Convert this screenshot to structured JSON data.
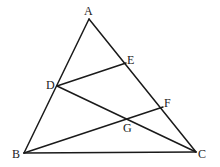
{
  "figure": {
    "type": "geometry",
    "points": {
      "A": {
        "label": "A"
      },
      "B": {
        "label": "B"
      },
      "C": {
        "label": "C"
      },
      "D": {
        "label": "D"
      },
      "E": {
        "label": "E"
      },
      "F": {
        "label": "F"
      },
      "G": {
        "label": "G"
      }
    },
    "segments": [
      {
        "id": "AB",
        "from": "A",
        "to": "B"
      },
      {
        "id": "BC",
        "from": "B",
        "to": "C"
      },
      {
        "id": "AC",
        "from": "A",
        "to": "C"
      },
      {
        "id": "DE",
        "from": "D",
        "to": "E"
      },
      {
        "id": "DC",
        "from": "D",
        "to": "C"
      },
      {
        "id": "BF",
        "from": "B",
        "to": "F"
      }
    ],
    "stroke_color": "#1a1a1a"
  }
}
